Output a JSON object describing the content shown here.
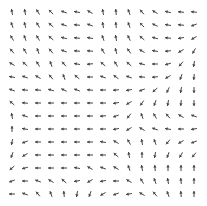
{
  "chart_data": {
    "type": "quiver",
    "title": "",
    "xlabel": "",
    "ylabel": "",
    "grid": false,
    "rows": 15,
    "cols": 15,
    "origin": [
      12,
      12
    ],
    "spacing": [
      13,
      13
    ],
    "arrow_length": 6,
    "arrow_color": "#444444",
    "angles_deg": [
      [
        -100,
        -100,
        -120,
        -135,
        -160,
        -170,
        -150,
        -100,
        -95,
        -110,
        -130,
        -150,
        -165,
        -175,
        -175
      ],
      [
        -110,
        -105,
        -120,
        -140,
        -160,
        -175,
        -160,
        -100,
        -95,
        -110,
        -135,
        -155,
        -170,
        -175,
        160
      ],
      [
        -120,
        -110,
        -120,
        -140,
        -165,
        -175,
        -170,
        -110,
        -100,
        -115,
        -140,
        -165,
        -175,
        170,
        150
      ],
      [
        -130,
        -120,
        -110,
        -130,
        -160,
        -175,
        -175,
        -120,
        -105,
        -125,
        -150,
        -170,
        175,
        150,
        120
      ],
      [
        -150,
        -140,
        -120,
        -110,
        -130,
        -170,
        175,
        -140,
        -120,
        -140,
        -165,
        180,
        165,
        130,
        100
      ],
      [
        -170,
        -160,
        -150,
        -130,
        -110,
        -140,
        180,
        -160,
        -145,
        -160,
        -175,
        175,
        150,
        110,
        95
      ],
      [
        -160,
        -175,
        -175,
        -165,
        -155,
        -160,
        -175,
        180,
        175,
        170,
        160,
        140,
        115,
        100,
        90
      ],
      [
        -140,
        -175,
        180,
        180,
        180,
        180,
        180,
        180,
        170,
        150,
        125,
        110,
        100,
        95,
        90
      ],
      [
        -100,
        -160,
        180,
        180,
        180,
        180,
        180,
        175,
        160,
        130,
        -110,
        -120,
        -130,
        -150,
        -160
      ],
      [
        -90,
        -170,
        180,
        180,
        180,
        180,
        180,
        180,
        170,
        150,
        -150,
        -160,
        -170,
        180,
        170
      ],
      [
        100,
        160,
        180,
        180,
        180,
        180,
        180,
        -170,
        -150,
        -120,
        -100,
        -110,
        130,
        150,
        160
      ],
      [
        110,
        150,
        180,
        180,
        180,
        180,
        180,
        180,
        -140,
        -100,
        -90,
        100,
        110,
        120,
        130
      ],
      [
        140,
        165,
        180,
        180,
        180,
        -170,
        -150,
        -160,
        -150,
        -110,
        -100,
        -95,
        -90,
        -90,
        -90
      ],
      [
        160,
        180,
        -160,
        -150,
        -140,
        170,
        150,
        170,
        180,
        -150,
        -120,
        -110,
        -100,
        -95,
        -90
      ],
      [
        180,
        -160,
        -130,
        -110,
        -95,
        100,
        110,
        150,
        160,
        170,
        -150,
        -130,
        -110,
        -95,
        -90
      ]
    ]
  }
}
